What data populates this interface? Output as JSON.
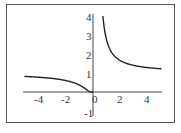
{
  "chart_data": {
    "type": "line",
    "title": "",
    "xlabel": "",
    "ylabel": "",
    "function": "y = e^(1/x)",
    "xlim": [
      -5,
      5
    ],
    "ylim": [
      -1,
      4
    ],
    "grid": false,
    "legend": null,
    "x_ticks": [
      "-4",
      "-2",
      "0",
      "2",
      "4"
    ],
    "y_ticks": [
      "4",
      "3",
      "2",
      "1",
      "-1"
    ],
    "series": [
      {
        "name": "left branch",
        "x": [
          -5,
          -4,
          -3,
          -2,
          -1.5,
          -1,
          -0.75,
          -0.5,
          -0.3,
          -0.2,
          -0.1,
          0
        ],
        "y": [
          0.82,
          0.78,
          0.72,
          0.61,
          0.51,
          0.37,
          0.26,
          0.14,
          0.04,
          0.01,
          0.0,
          0.0
        ]
      },
      {
        "name": "right branch",
        "x": [
          0.72,
          0.8,
          1,
          1.25,
          1.5,
          2,
          2.5,
          3,
          3.5,
          4,
          4.5,
          5
        ],
        "y": [
          4.0,
          3.49,
          2.72,
          2.23,
          1.95,
          1.65,
          1.49,
          1.4,
          1.33,
          1.28,
          1.25,
          1.22
        ]
      }
    ],
    "colors": {
      "curve": "#222222",
      "axis": "#444444",
      "frame": "#555555"
    }
  }
}
